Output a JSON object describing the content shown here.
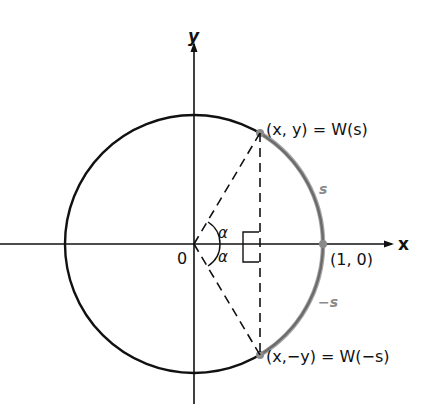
{
  "axes": {
    "x_label": "x",
    "y_label": "y",
    "origin_label": "0"
  },
  "points": {
    "upper": "(x, y) = W(s)",
    "lower": "(x,−y) = W(−s)",
    "unit": "(1, 0)"
  },
  "arcs": {
    "upper_arc_label": "s",
    "lower_arc_label": "−s"
  },
  "angles": {
    "upper": "α",
    "lower": "α"
  },
  "colors": {
    "line": "#111111",
    "highlight": "#8a8a8a"
  }
}
